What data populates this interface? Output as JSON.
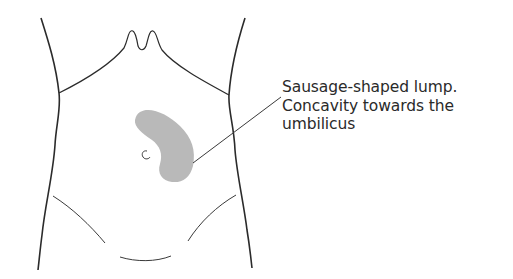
{
  "figure": {
    "colors": {
      "outline": "#2b2b2b",
      "lump_fill": "#b9b9b9",
      "leader_line": "#3a3a3a",
      "text": "#2a2a2a",
      "background": "#ffffff"
    },
    "annotation": {
      "lines": [
        "Sausage-shaped lump.",
        "Concavity towards the",
        "umbilicus"
      ]
    },
    "parts": [
      "left-flank-outline",
      "right-flank-outline",
      "costal-margin",
      "xiphoid-notch",
      "sausage-shaped-lump",
      "umbilicus",
      "left-inguinal-line",
      "right-inguinal-line",
      "pubic-line",
      "leader-line"
    ]
  }
}
